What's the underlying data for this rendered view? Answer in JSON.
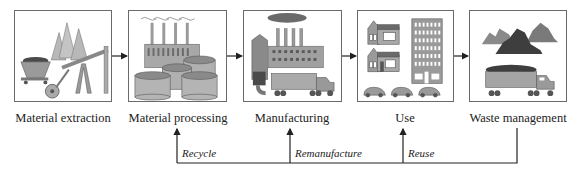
{
  "diagram": {
    "type": "material-lifecycle-flow",
    "stages": [
      {
        "id": "extraction",
        "label": "Material extraction",
        "icons": [
          "trees",
          "ore-cart",
          "oil-pumpjack"
        ]
      },
      {
        "id": "processing",
        "label": "Material processing",
        "icons": [
          "factory-with-smokestacks",
          "storage-tanks"
        ]
      },
      {
        "id": "manufacturing",
        "label": "Manufacturing",
        "icons": [
          "factory",
          "smoke-cloud",
          "silo",
          "truck"
        ]
      },
      {
        "id": "use",
        "label": "Use",
        "icons": [
          "houses",
          "apartment-building",
          "cars"
        ]
      },
      {
        "id": "waste",
        "label": "Waste management",
        "icons": [
          "landfill-piles",
          "dump-truck"
        ]
      }
    ],
    "forward_flow": [
      "extraction->processing",
      "processing->manufacturing",
      "manufacturing->use",
      "use->waste"
    ],
    "feedback": [
      {
        "label": "Recycle",
        "target": "processing"
      },
      {
        "label": "Remanufacture",
        "target": "manufacturing"
      },
      {
        "label": "Reuse",
        "target": "use"
      }
    ],
    "feedback_source": "waste",
    "colors": {
      "line": "#222222",
      "border": "#6a6a6a",
      "fill_light": "#b4b4b4",
      "fill_mid": "#8c8c8c",
      "fill_dark": "#4a4a4a"
    }
  }
}
